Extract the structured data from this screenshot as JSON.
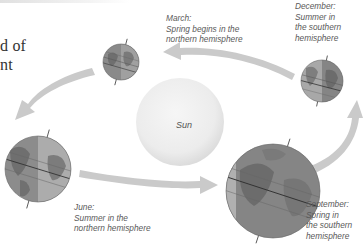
{
  "heading_fragment": {
    "line1": "d of",
    "line2": "nt"
  },
  "sun": {
    "label": "Sun",
    "color": "#eaeaea"
  },
  "seasons": [
    {
      "id": "march",
      "month": "March:",
      "lines": [
        "Spring begins in the",
        "northern hemisphere"
      ]
    },
    {
      "id": "december",
      "month": "December:",
      "lines": [
        "Summer in",
        "the southern",
        "hemisphere"
      ]
    },
    {
      "id": "june",
      "month": "June:",
      "lines": [
        "Summer in the",
        "northern hemisphere"
      ]
    },
    {
      "id": "september",
      "month": "September:",
      "lines": [
        "Spring in",
        "the southern",
        "hemisphere"
      ]
    }
  ],
  "colors": {
    "arrow": "#c9c9c9",
    "globe_day": "#a9a9a9",
    "globe_night": "#7d7d7d",
    "land": "#8e8e8e",
    "text": "#5a5a5a"
  }
}
